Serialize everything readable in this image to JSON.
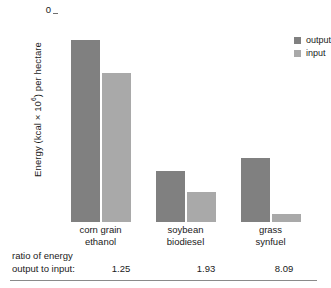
{
  "chart_data": {
    "type": "bar",
    "title": "",
    "xlabel": "",
    "ylabel": "Energy (kcal × 10^6) per hectare",
    "ylabel_prefix": "Energy (kcal × 10",
    "ylabel_exponent": "6",
    "ylabel_suffix": ") per hectare",
    "categories": [
      "corn grain ethanol",
      "soybean biodiesel",
      "grass synfuel"
    ],
    "category_lines": [
      {
        "line1": "corn grain",
        "line2": "ethanol"
      },
      {
        "line1": "soybean",
        "line2": "biodiesel"
      },
      {
        "line1": "grass",
        "line2": "synfuel"
      }
    ],
    "series": [
      {
        "name": "output",
        "color": "#808080",
        "values": [
          22.0,
          6.2,
          7.7
        ]
      },
      {
        "name": "input",
        "color": "#a9a9a9",
        "values": [
          18.0,
          3.6,
          1.0
        ]
      }
    ],
    "ylim": [
      0,
      25
    ],
    "yticks": [
      0,
      5,
      10,
      15,
      20,
      25
    ],
    "ytick_labels": [
      "0",
      "5",
      "10",
      "15",
      "20",
      "25"
    ],
    "grid": false,
    "legend_position": "top-right"
  },
  "legend": {
    "entries": [
      {
        "label": "output",
        "color": "#808080"
      },
      {
        "label": "input",
        "color": "#a9a9a9"
      }
    ]
  },
  "footnote": {
    "label_line1": "ratio of energy",
    "label_line2": "output to input:",
    "values": [
      "1.25",
      "1.93",
      "8.09"
    ]
  },
  "colors": {
    "output": "#808080",
    "input": "#a9a9a9",
    "axis": "#6f6f6f",
    "text": "#1a1a1a",
    "rule": "#8a8a8a",
    "background": "#ffffff"
  }
}
